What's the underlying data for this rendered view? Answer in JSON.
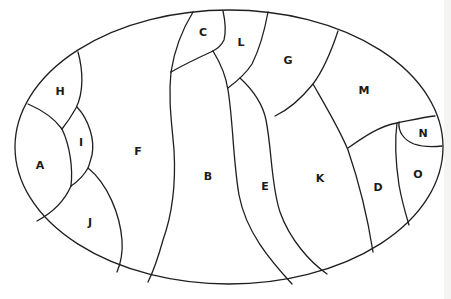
{
  "diagram": {
    "type": "region-map",
    "outline": "ellipse",
    "stroke_color": "#1f1f1f",
    "background": "#ffffff",
    "regions": [
      {
        "id": "A",
        "label": "A",
        "x": 40,
        "y": 166
      },
      {
        "id": "B",
        "label": "B",
        "x": 208,
        "y": 177
      },
      {
        "id": "C",
        "label": "C",
        "x": 203,
        "y": 33
      },
      {
        "id": "D",
        "label": "D",
        "x": 378,
        "y": 188
      },
      {
        "id": "E",
        "label": "E",
        "x": 265,
        "y": 187
      },
      {
        "id": "F",
        "label": "F",
        "x": 138,
        "y": 152
      },
      {
        "id": "G",
        "label": "G",
        "x": 288,
        "y": 61
      },
      {
        "id": "H",
        "label": "H",
        "x": 60,
        "y": 92
      },
      {
        "id": "I",
        "label": "I",
        "x": 81,
        "y": 143
      },
      {
        "id": "J",
        "label": "J",
        "x": 90,
        "y": 223
      },
      {
        "id": "K",
        "label": "K",
        "x": 320,
        "y": 179
      },
      {
        "id": "L",
        "label": "L",
        "x": 241,
        "y": 43
      },
      {
        "id": "M",
        "label": "M",
        "x": 364,
        "y": 91
      },
      {
        "id": "N",
        "label": "N",
        "x": 423,
        "y": 134
      },
      {
        "id": "O",
        "label": "O",
        "x": 418,
        "y": 175
      }
    ]
  }
}
